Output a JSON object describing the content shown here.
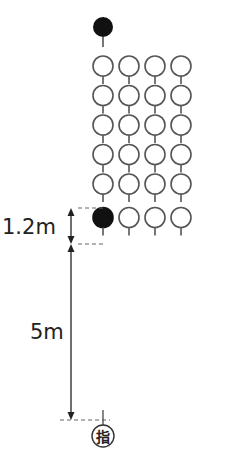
{
  "diagram": {
    "type": "formation-layout",
    "leader_marker": {
      "role": "leader",
      "fill": "#111111"
    },
    "grid": {
      "rows": 6,
      "cols": 4
    },
    "filled_member": {
      "row": 6,
      "col": 1,
      "fill": "#111111"
    },
    "dimensions": [
      {
        "label": "1.2m",
        "from": "row 5",
        "to": "row 6"
      },
      {
        "label": "5m",
        "from": "row 6",
        "to": "instructor"
      }
    ],
    "instructor_marker": {
      "glyph": "指"
    },
    "colors": {
      "stroke": "#555555",
      "filled": "#111111",
      "text": "#222222"
    }
  }
}
